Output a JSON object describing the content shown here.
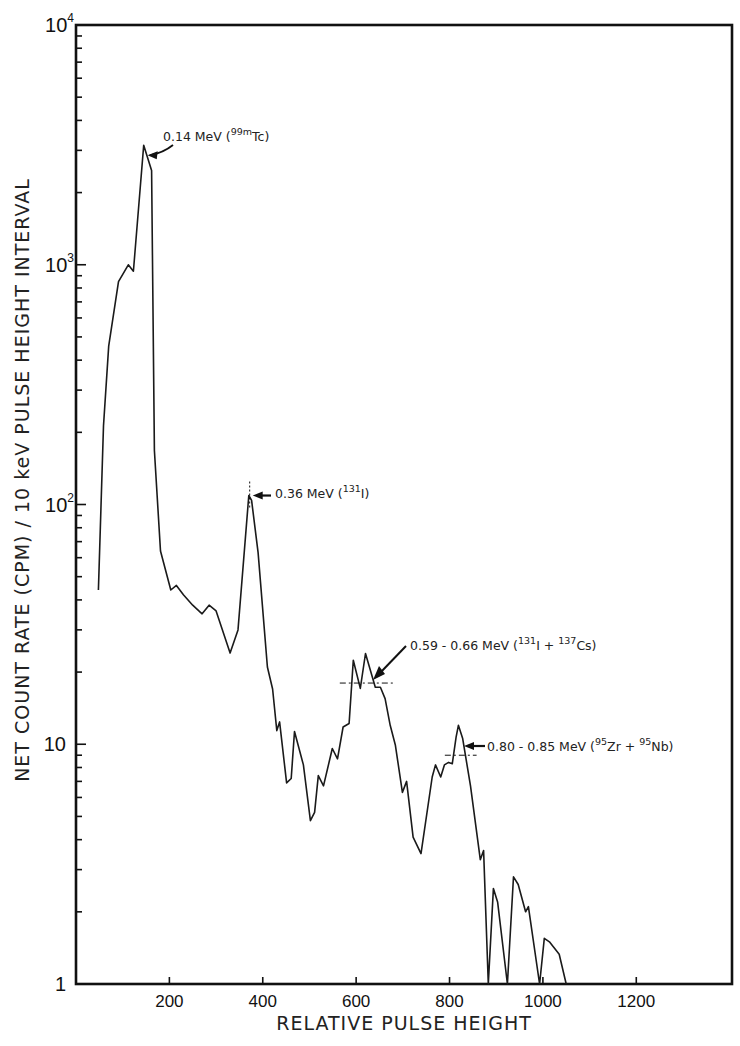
{
  "chart_data": {
    "type": "line",
    "title": "",
    "xlabel": "RELATIVE PULSE HEIGHT",
    "ylabel": "NET COUNT RATE (CPM) / 10 keV PULSE HEIGHT INTERVAL",
    "xlim": [
      0,
      1405
    ],
    "ylim": [
      1,
      10000
    ],
    "yscale": "log",
    "grid": false,
    "legend": null,
    "x_ticks": [
      200,
      400,
      600,
      800,
      1000,
      1200
    ],
    "x_tick_labels": [
      "200",
      "400",
      "600",
      "800",
      "1000",
      "1200"
    ],
    "y_ticks": [
      1,
      10,
      100,
      1000,
      10000
    ],
    "y_tick_labels": [
      {
        "base": "1",
        "exp": ""
      },
      {
        "base": "10",
        "exp": ""
      },
      {
        "base": "10",
        "exp": "2"
      },
      {
        "base": "10",
        "exp": "3"
      },
      {
        "base": "10",
        "exp": "4"
      }
    ],
    "series": [
      {
        "name": "Gamma spectrum",
        "x": [
          48,
          59,
          70,
          91,
          112,
          123,
          145,
          162,
          168,
          181,
          203,
          215,
          230,
          250,
          270,
          285,
          300,
          330,
          347,
          370,
          376,
          390,
          410,
          421,
          430,
          436,
          451,
          461,
          468,
          487,
          502,
          511,
          519,
          530,
          549,
          560,
          572,
          585,
          594,
          609,
          620,
          641,
          652,
          662,
          673,
          684,
          699,
          708,
          722,
          739,
          763,
          770,
          781,
          789,
          798,
          806,
          814,
          819,
          828,
          845,
          866,
          873,
          883,
          894,
          903,
          924,
          937,
          947,
          963,
          969,
          993,
          1003,
          1014,
          1035,
          1050
        ],
        "y": [
          44,
          213,
          458,
          850,
          1000,
          940,
          3150,
          2470,
          168,
          64,
          44,
          46,
          42,
          38,
          35,
          38,
          36,
          24,
          30,
          109,
          104,
          63,
          21,
          17,
          11.4,
          12.4,
          6.9,
          7.2,
          11.3,
          8.2,
          4.8,
          5.2,
          7.4,
          6.7,
          9.6,
          8.7,
          11.8,
          12.2,
          22.4,
          17.1,
          23.9,
          17.3,
          17.3,
          15.5,
          12,
          9.9,
          6.3,
          7.0,
          4.1,
          3.5,
          7.3,
          8.2,
          7.3,
          8.2,
          8.4,
          8.3,
          10.7,
          12.0,
          10.6,
          6.7,
          3.3,
          3.6,
          1,
          2.5,
          2.2,
          1,
          2.8,
          2.6,
          2.0,
          2.1,
          1,
          1.55,
          1.5,
          1.33,
          1
        ]
      }
    ],
    "annotations": [
      {
        "text_pre": "0.14 MeV (",
        "sup": "99m",
        "text_post": "Tc)",
        "x": 145,
        "y": 3150,
        "label_x": 163,
        "label_y": 141
      },
      {
        "text_pre": "0.36 MeV (",
        "sup": "131",
        "text_post": "I)",
        "x": 372,
        "y": 109,
        "label_x": 275,
        "label_y": 498
      },
      {
        "text_pre": "0.59 - 0.66 MeV (",
        "sup": "131",
        "text_post": "I + ",
        "sup2": "137",
        "text_post2": "Cs)",
        "x": 630,
        "y": 18,
        "label_x": 410,
        "label_y": 650
      },
      {
        "text_pre": "0.80 - 0.85 MeV (",
        "sup": "95",
        "text_post": "Zr + ",
        "sup2": "95",
        "text_post2": "Nb)",
        "x": 835,
        "y": 9,
        "label_x": 487,
        "label_y": 751
      }
    ]
  }
}
